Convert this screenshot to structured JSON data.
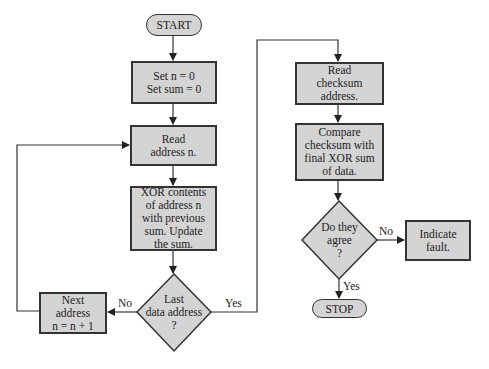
{
  "flowchart": {
    "start": "START",
    "stop": "STOP",
    "init": {
      "line1": "Set n = 0",
      "line2": "Set sum = 0"
    },
    "read_address": {
      "line1": "Read",
      "line2": "address n."
    },
    "xor": {
      "line1": "XOR contents",
      "line2": "of address n",
      "line3": "with previous",
      "line4": "sum.  Update",
      "line5": "the sum."
    },
    "last_decision": {
      "line1": "Last",
      "line2": "data address",
      "line3": "?"
    },
    "next_address": {
      "line1": "Next",
      "line2": "address",
      "line3": "n = n + 1"
    },
    "read_checksum": {
      "line1": "Read",
      "line2": "checksum",
      "line3": "address."
    },
    "compare": {
      "line1": "Compare",
      "line2": "checksum with",
      "line3": "final XOR sum",
      "line4": "of data."
    },
    "agree_decision": {
      "line1": "Do they",
      "line2": "agree",
      "line3": "?"
    },
    "indicate_fault": {
      "line1": "Indicate",
      "line2": "fault."
    },
    "labels": {
      "no1": "No",
      "yes1": "Yes",
      "no2": "No",
      "yes2": "Yes"
    }
  },
  "colors": {
    "fill": "#d4d4d4",
    "stroke": "#333333"
  }
}
